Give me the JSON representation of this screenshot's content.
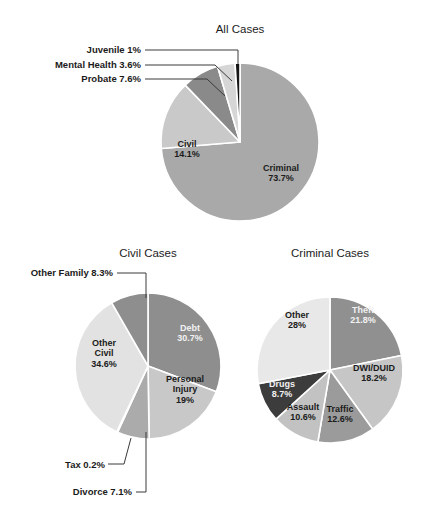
{
  "figure": {
    "background": "#ffffff",
    "width": 440,
    "height": 512
  },
  "chart_data": [
    {
      "type": "pie",
      "id": "all-cases",
      "title": "All Cases",
      "title_pos": {
        "x": 240,
        "y": 33
      },
      "center": {
        "x": 240,
        "y": 142
      },
      "radius": 79,
      "start_angle": 0,
      "direction": "clockwise",
      "labels": [
        "Criminal",
        "Civil",
        "Probate",
        "Mental Health",
        "Juvenile"
      ],
      "values": [
        73.7,
        14.1,
        7.6,
        3.6,
        1.0
      ],
      "value_text": [
        "73.7%",
        "14.1%",
        "7.6%",
        "3.6%",
        "1%"
      ],
      "colors": [
        "#a9a9a9",
        "#c9c9c9",
        "#8a8a8a",
        "#d6d6d6",
        "#151515"
      ],
      "slices": [
        {
          "name": "Criminal",
          "value": 73.7,
          "value_text": "73.7%",
          "color": "#a9a9a9",
          "label_mode": "inside",
          "label_pos": {
            "x": 281,
            "y": 176
          },
          "text_color": "dark"
        },
        {
          "name": "Civil",
          "value": 14.1,
          "value_text": "14.1%",
          "color": "#c9c9c9",
          "label_mode": "inside",
          "label_pos": {
            "x": 187,
            "y": 152
          },
          "text_color": "dark"
        },
        {
          "name": "Probate",
          "value": 7.6,
          "value_text": "7.6%",
          "color": "#8a8a8a",
          "label_mode": "callout",
          "label_pos": {
            "x": 141,
            "y": 82
          },
          "leader": [
            [
              145,
              79
            ],
            [
              207,
              79
            ],
            [
              225,
              96
            ]
          ]
        },
        {
          "name": "Mental Health",
          "value": 3.6,
          "value_text": "3.6%",
          "color": "#d6d6d6",
          "label_mode": "callout",
          "label_pos": {
            "x": 141,
            "y": 68
          },
          "leader": [
            [
              145,
              65
            ],
            [
              215,
              65
            ],
            [
              232,
              81
            ]
          ]
        },
        {
          "name": "Juvenile",
          "value": 1.0,
          "value_text": "1%",
          "color": "#151515",
          "label_mode": "callout",
          "label_pos": {
            "x": 141,
            "y": 53
          },
          "leader": [
            [
              145,
              50
            ],
            [
              238,
              50
            ],
            [
              238,
              64
            ]
          ]
        }
      ],
      "legend": "none",
      "grid": false
    },
    {
      "type": "pie",
      "id": "civil-cases",
      "title": "Civil Cases",
      "title_pos": {
        "x": 148,
        "y": 257
      },
      "center": {
        "x": 148,
        "y": 366
      },
      "radius": 73,
      "start_angle": 0,
      "direction": "clockwise",
      "labels": [
        "Debt",
        "Personal Injury",
        "Divorce",
        "Tax",
        "Other Civil",
        "Other Family"
      ],
      "values": [
        30.7,
        19.0,
        7.1,
        0.2,
        34.6,
        8.3
      ],
      "value_text": [
        "30.7%",
        "19%",
        "7.1%",
        "0.2%",
        "34.6%",
        "8.3%"
      ],
      "colors": [
        "#8e8e8e",
        "#c8c8c8",
        "#ababab",
        "#dedede",
        "#e2e2e2",
        "#8e8e8e"
      ],
      "slices": [
        {
          "name": "Debt",
          "value": 30.7,
          "value_text": "30.7%",
          "color": "#8e8e8e",
          "label_mode": "inside",
          "label_pos": {
            "x": 190,
            "y": 336
          },
          "text_color": "light"
        },
        {
          "name": "Personal Injury",
          "value": 19.0,
          "value_text": "19%",
          "color": "#c8c8c8",
          "label_mode": "inside",
          "label_pos": {
            "x": 185,
            "y": 392
          },
          "text_color": "dark",
          "label_lines": [
            "Personal",
            "Injury"
          ]
        },
        {
          "name": "Divorce",
          "value": 7.1,
          "value_text": "7.1%",
          "color": "#ababab",
          "label_mode": "callout",
          "label_pos": {
            "x": 132,
            "y": 495
          },
          "leader": [
            [
              136,
              492
            ],
            [
              146,
              492
            ],
            [
              146,
              432
            ]
          ]
        },
        {
          "name": "Tax",
          "value": 0.2,
          "value_text": "0.2%",
          "color": "#dedede",
          "label_mode": "callout",
          "label_pos": {
            "x": 105,
            "y": 468
          },
          "leader": [
            [
              108,
              464
            ],
            [
              124,
              464
            ],
            [
              131,
              438
            ]
          ]
        },
        {
          "name": "Other Civil",
          "value": 34.6,
          "value_text": "34.6%",
          "color": "#e2e2e2",
          "label_mode": "inside",
          "label_pos": {
            "x": 104,
            "y": 356
          },
          "text_color": "dark",
          "label_lines": [
            "Other",
            "Civil"
          ]
        },
        {
          "name": "Other Family",
          "value": 8.3,
          "value_text": "8.3%",
          "color": "#8e8e8e",
          "label_mode": "callout",
          "label_pos": {
            "x": 113,
            "y": 276
          },
          "leader": [
            [
              117,
              273
            ],
            [
              146,
              273
            ],
            [
              146,
              298
            ]
          ]
        }
      ],
      "legend": "none",
      "grid": false
    },
    {
      "type": "pie",
      "id": "criminal-cases",
      "title": "Criminal Cases",
      "title_pos": {
        "x": 330,
        "y": 257
      },
      "center": {
        "x": 330,
        "y": 370
      },
      "radius": 73,
      "start_angle": 0,
      "direction": "clockwise",
      "labels": [
        "Theft",
        "DWI/DUID",
        "Traffic",
        "Assault",
        "Drugs",
        "Other"
      ],
      "values": [
        21.8,
        18.2,
        12.6,
        10.6,
        8.7,
        28.0
      ],
      "value_text": [
        "21.8%",
        "18.2%",
        "12.6%",
        "10.6%",
        "8.7%",
        "28%"
      ],
      "colors": [
        "#909090",
        "#c6c6c6",
        "#9b9b9b",
        "#c2c2c2",
        "#3c3c3c",
        "#e8e8e8"
      ],
      "slices": [
        {
          "name": "Theft",
          "value": 21.8,
          "value_text": "21.8%",
          "color": "#909090",
          "label_mode": "inside",
          "label_pos": {
            "x": 363,
            "y": 318
          },
          "text_color": "light"
        },
        {
          "name": "DWI/DUID",
          "value": 18.2,
          "value_text": "18.2%",
          "color": "#c6c6c6",
          "label_mode": "inside",
          "label_pos": {
            "x": 374,
            "y": 376
          },
          "text_color": "dark"
        },
        {
          "name": "Traffic",
          "value": 12.6,
          "value_text": "12.6%",
          "color": "#9b9b9b",
          "label_mode": "inside",
          "label_pos": {
            "x": 340,
            "y": 417
          },
          "text_color": "dark"
        },
        {
          "name": "Assault",
          "value": 10.6,
          "value_text": "10.6%",
          "color": "#c2c2c2",
          "label_mode": "inside",
          "label_pos": {
            "x": 303,
            "y": 415
          },
          "text_color": "dark"
        },
        {
          "name": "Drugs",
          "value": 8.7,
          "value_text": "8.7%",
          "color": "#3c3c3c",
          "label_mode": "inside",
          "label_pos": {
            "x": 282,
            "y": 392
          },
          "text_color": "light"
        },
        {
          "name": "Other",
          "value": 28.0,
          "value_text": "28%",
          "color": "#e8e8e8",
          "label_mode": "inside",
          "label_pos": {
            "x": 297,
            "y": 323
          },
          "text_color": "dark"
        }
      ],
      "legend": "none",
      "grid": false
    }
  ]
}
